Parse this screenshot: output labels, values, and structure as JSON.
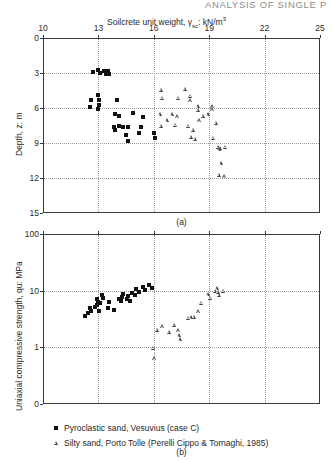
{
  "running_head": "ANALYSIS OF SINGLE P",
  "figure": {
    "panel_a_id": "(a)",
    "panel_b_id": "(b)"
  },
  "legend": {
    "items": [
      {
        "symbol": "filled-square",
        "label": "Pyroclastic sand, Vesuvius (case C)"
      },
      {
        "symbol": "open-triangle",
        "label": "Silty sand, Porto Tolle (Perelli Cippo & Tornaghi, 1985)"
      }
    ]
  },
  "chart_data": [
    {
      "type": "scatter",
      "panel": "(a)",
      "title": "",
      "xlabel": "Soilcrete unit weight, γsc: kN/m³",
      "ylabel": "Depth, z: m",
      "xlim": [
        10,
        25
      ],
      "ylim": [
        0,
        15
      ],
      "y_inverted": true,
      "xticks": [
        10,
        13,
        16,
        19,
        22,
        25
      ],
      "yticks": [
        0,
        3,
        6,
        9,
        12,
        15
      ],
      "xtick_labels": [
        "10",
        "13",
        "16",
        "19",
        "22",
        "25"
      ],
      "ytick_labels": [
        "0",
        "3",
        "6",
        "9",
        "12",
        "15"
      ],
      "grid": true,
      "legend_position": "below-figure",
      "series": [
        {
          "name": "Pyroclastic sand, Vesuvius (case C)",
          "marker": "filled-square",
          "points": [
            [
              12.7,
              2.9
            ],
            [
              13.0,
              2.7
            ],
            [
              13.1,
              3.0
            ],
            [
              13.3,
              2.8
            ],
            [
              13.4,
              3.1
            ],
            [
              13.5,
              2.8
            ],
            [
              13.6,
              3.1
            ],
            [
              12.6,
              5.3
            ],
            [
              13.0,
              4.9
            ],
            [
              13.05,
              5.3
            ],
            [
              13.05,
              5.7
            ],
            [
              12.55,
              5.9
            ],
            [
              13.0,
              6.1
            ],
            [
              14.0,
              5.3
            ],
            [
              13.9,
              6.5
            ],
            [
              14.1,
              6.7
            ],
            [
              14.9,
              6.4
            ],
            [
              15.4,
              6.8
            ],
            [
              13.85,
              7.6
            ],
            [
              14.1,
              7.55
            ],
            [
              14.35,
              7.6
            ],
            [
              14.6,
              7.6
            ],
            [
              13.9,
              7.9
            ],
            [
              14.5,
              8.3
            ],
            [
              15.3,
              7.6
            ],
            [
              15.2,
              8.1
            ],
            [
              16.0,
              8.1
            ],
            [
              16.05,
              8.6
            ],
            [
              14.6,
              8.8
            ]
          ]
        },
        {
          "name": "Silty sand, Porto Tolle (Perelli Cippo & Tornaghi, 1985)",
          "marker": "open-triangle",
          "points": [
            [
              16.4,
              4.5
            ],
            [
              17.7,
              4.4
            ],
            [
              16.5,
              5.2
            ],
            [
              17.35,
              5.2
            ],
            [
              18.0,
              5.0
            ],
            [
              18.0,
              5.4
            ],
            [
              18.4,
              5.9
            ],
            [
              18.4,
              6.2
            ],
            [
              19.2,
              5.9
            ],
            [
              19.2,
              6.15
            ],
            [
              16.35,
              6.6
            ],
            [
              17.0,
              6.6
            ],
            [
              17.3,
              6.75
            ],
            [
              16.75,
              7.1
            ],
            [
              18.7,
              6.7
            ],
            [
              18.95,
              6.6
            ],
            [
              18.5,
              7.1
            ],
            [
              16.4,
              7.6
            ],
            [
              17.2,
              7.5
            ],
            [
              17.9,
              7.6
            ],
            [
              19.4,
              7.3
            ],
            [
              18.15,
              7.9
            ],
            [
              18.05,
              8.5
            ],
            [
              18.25,
              8.7
            ],
            [
              19.25,
              8.6
            ],
            [
              19.5,
              9.4
            ],
            [
              19.6,
              9.45
            ],
            [
              19.9,
              9.4
            ],
            [
              19.55,
              9.6
            ],
            [
              19.65,
              10.8
            ],
            [
              19.55,
              11.8
            ],
            [
              19.85,
              11.9
            ]
          ]
        }
      ]
    },
    {
      "type": "scatter",
      "panel": "(b)",
      "title": "",
      "xlabel": "Soilcrete unit weight, γsc: kN/m³",
      "ylabel": "Uniaxial compressive strength, qu: MPa",
      "xlim": [
        10,
        25
      ],
      "ylim": [
        0.1,
        100
      ],
      "yscale": "log",
      "xticks": [
        10,
        13,
        16,
        19,
        22,
        25
      ],
      "yticks": [
        100,
        10,
        1,
        0.1
      ],
      "xtick_labels": [
        "",
        "",
        "",
        "",
        "",
        ""
      ],
      "ytick_labels": [
        "100",
        "10",
        "1",
        "0"
      ],
      "grid": true,
      "legend_position": "below-figure",
      "series": [
        {
          "name": "Pyroclastic sand, Vesuvius (case C)",
          "marker": "filled-square",
          "points": [
            [
              12.3,
              3.6
            ],
            [
              12.45,
              4.0
            ],
            [
              12.6,
              4.3
            ],
            [
              12.55,
              5.0
            ],
            [
              12.8,
              5.2
            ],
            [
              12.9,
              5.6
            ],
            [
              13.0,
              6.4
            ],
            [
              13.1,
              6.0
            ],
            [
              12.95,
              7.2
            ],
            [
              13.25,
              7.4
            ],
            [
              13.2,
              8.3
            ],
            [
              13.05,
              4.3
            ],
            [
              13.5,
              5.0
            ],
            [
              13.6,
              6.3
            ],
            [
              13.85,
              4.6
            ],
            [
              14.1,
              7.2
            ],
            [
              14.2,
              6.5
            ],
            [
              14.3,
              7.6
            ],
            [
              14.35,
              8.6
            ],
            [
              14.55,
              7.0
            ],
            [
              14.6,
              8.0
            ],
            [
              14.7,
              6.6
            ],
            [
              14.8,
              9.1
            ],
            [
              15.0,
              8.5
            ],
            [
              15.05,
              10.5
            ],
            [
              15.2,
              9.6
            ],
            [
              15.4,
              11.5
            ],
            [
              15.55,
              10.2
            ],
            [
              15.75,
              12.6
            ],
            [
              15.9,
              11.0
            ]
          ]
        },
        {
          "name": "Silty sand, Porto Tolle (Perelli Cippo & Tornaghi, 1985)",
          "marker": "open-triangle",
          "points": [
            [
              16.2,
              2.0
            ],
            [
              16.5,
              2.3
            ],
            [
              16.85,
              1.85
            ],
            [
              17.1,
              2.45
            ],
            [
              17.35,
              1.95
            ],
            [
              17.4,
              1.6
            ],
            [
              17.45,
              1.35
            ],
            [
              17.9,
              3.2
            ],
            [
              18.05,
              3.3
            ],
            [
              18.2,
              3.35
            ],
            [
              18.45,
              4.2
            ],
            [
              18.6,
              5.9
            ],
            [
              19.1,
              7.3
            ],
            [
              19.35,
              9.6
            ],
            [
              19.45,
              10.8
            ],
            [
              19.5,
              9.4
            ],
            [
              19.55,
              8.2
            ],
            [
              19.8,
              9.7
            ],
            [
              16.0,
              0.95
            ],
            [
              16.05,
              0.62
            ],
            [
              18.95,
              8.4
            ]
          ]
        }
      ]
    }
  ]
}
